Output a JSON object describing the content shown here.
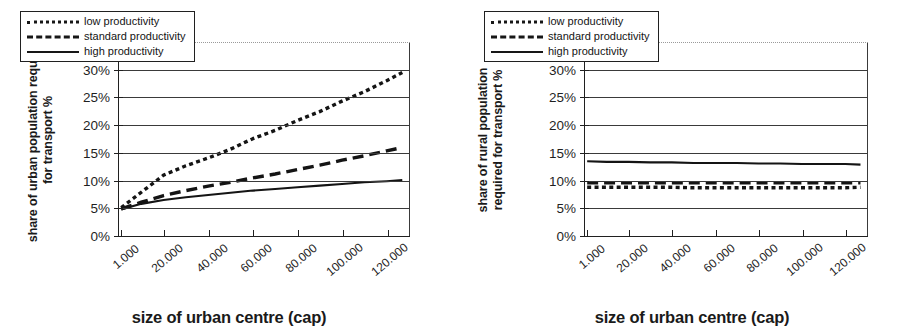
{
  "figure": {
    "panels": [
      {
        "id": "urban",
        "ytitle_line1": "share of urban population required",
        "ytitle_line2": "for transport %",
        "xtitle": "size of urban centre (cap)",
        "legend": [
          {
            "label": "low productivity",
            "style": "dotted"
          },
          {
            "label": "standard productivity",
            "style": "dashed"
          },
          {
            "label": "high productivity",
            "style": "solid"
          }
        ],
        "yticks": [
          "0%",
          "5%",
          "10%",
          "15%",
          "20%",
          "25%",
          "30%",
          "35%"
        ],
        "xticks": [
          "1.000",
          "20.000",
          "40.000",
          "60.000",
          "80.000",
          "100.000",
          "120.000"
        ]
      },
      {
        "id": "rural",
        "ytitle_line1": "share of rural population",
        "ytitle_line2": "required for transport %",
        "xtitle": "size of urban centre (cap)",
        "legend": [
          {
            "label": "low productivity",
            "style": "dotted"
          },
          {
            "label": "standard productivity",
            "style": "dashed"
          },
          {
            "label": "high productivity",
            "style": "solid"
          }
        ],
        "yticks": [
          "0%",
          "5%",
          "10%",
          "15%",
          "20%",
          "25%",
          "30%",
          "35%"
        ],
        "xticks": [
          "1.000",
          "20.000",
          "40.000",
          "60.000",
          "80.000",
          "100.000",
          "120.000"
        ]
      }
    ]
  },
  "chart_data": [
    {
      "type": "line",
      "title": "",
      "xlabel": "size of urban centre (cap)",
      "ylabel": "share of urban population required for transport %",
      "xlim": [
        0,
        130000
      ],
      "ylim": [
        0,
        35
      ],
      "ytick_values": [
        0,
        5,
        10,
        15,
        20,
        25,
        30,
        35
      ],
      "xtick_values": [
        1000,
        20000,
        40000,
        60000,
        80000,
        100000,
        120000
      ],
      "grid": true,
      "legend_position": "upper-left",
      "x": [
        1000,
        10000,
        20000,
        30000,
        40000,
        50000,
        60000,
        70000,
        80000,
        90000,
        100000,
        110000,
        120000,
        127000
      ],
      "series": [
        {
          "name": "low productivity",
          "style": "dotted",
          "values": [
            5.0,
            7.8,
            10.9,
            12.6,
            14.0,
            15.6,
            17.5,
            19.0,
            20.8,
            22.4,
            24.3,
            26.0,
            28.0,
            29.5
          ]
        },
        {
          "name": "standard productivity",
          "style": "dashed",
          "values": [
            4.8,
            6.0,
            7.2,
            8.1,
            8.9,
            9.6,
            10.4,
            11.1,
            11.9,
            12.7,
            13.6,
            14.4,
            15.3,
            15.9
          ]
        },
        {
          "name": "high productivity",
          "style": "solid",
          "values": [
            4.7,
            5.7,
            6.4,
            6.9,
            7.3,
            7.7,
            8.1,
            8.4,
            8.7,
            9.0,
            9.3,
            9.6,
            9.8,
            10.0
          ]
        }
      ]
    },
    {
      "type": "line",
      "title": "",
      "xlabel": "size of urban centre (cap)",
      "ylabel": "share of rural population required for transport %",
      "xlim": [
        0,
        130000
      ],
      "ylim": [
        0,
        35
      ],
      "ytick_values": [
        0,
        5,
        10,
        15,
        20,
        25,
        30,
        35
      ],
      "xtick_values": [
        1000,
        20000,
        40000,
        60000,
        80000,
        100000,
        120000
      ],
      "grid": true,
      "legend_position": "upper-left",
      "x": [
        1000,
        10000,
        20000,
        30000,
        40000,
        50000,
        60000,
        70000,
        80000,
        90000,
        100000,
        110000,
        120000,
        127000
      ],
      "series": [
        {
          "name": "low productivity",
          "style": "dotted",
          "values": [
            8.7,
            8.7,
            8.7,
            8.7,
            8.7,
            8.6,
            8.6,
            8.6,
            8.6,
            8.6,
            8.6,
            8.6,
            8.6,
            8.7
          ]
        },
        {
          "name": "standard productivity",
          "style": "dashed",
          "values": [
            9.5,
            9.5,
            9.5,
            9.5,
            9.5,
            9.5,
            9.5,
            9.5,
            9.5,
            9.5,
            9.5,
            9.5,
            9.5,
            9.5
          ]
        },
        {
          "name": "high productivity",
          "style": "solid",
          "values": [
            13.4,
            13.3,
            13.3,
            13.2,
            13.2,
            13.1,
            13.1,
            13.1,
            13.0,
            13.0,
            12.9,
            12.9,
            12.9,
            12.8
          ]
        }
      ]
    }
  ]
}
